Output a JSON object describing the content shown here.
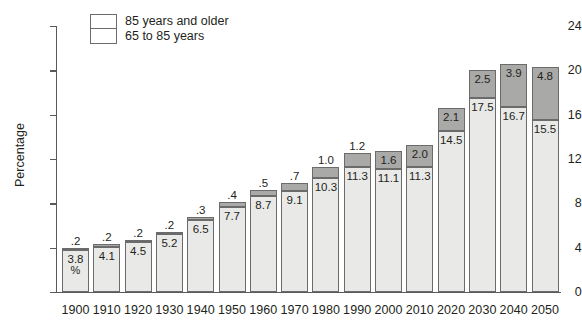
{
  "chart_data": {
    "type": "bar",
    "title": "",
    "subtype": "stacked-bar",
    "xlabel": "",
    "ylabel": "Percentage",
    "ylim": [
      0,
      24
    ],
    "ytick_values": [
      0,
      4,
      8,
      12,
      16,
      20,
      24
    ],
    "ytick_labels": [
      "0",
      "4",
      "8",
      "12",
      "16",
      "20",
      "24"
    ],
    "grid": false,
    "legend_position": "top-left",
    "categories": [
      "1900",
      "1910",
      "1920",
      "1930",
      "1940",
      "1950",
      "1960",
      "1970",
      "1980",
      "1990",
      "2000",
      "2010",
      "2020",
      "2030",
      "2040",
      "2050"
    ],
    "series": [
      {
        "name": "65 to 85 years",
        "color": "#e9e9e7",
        "values": [
          3.8,
          4.1,
          4.5,
          5.2,
          6.5,
          7.7,
          8.7,
          9.1,
          10.3,
          11.3,
          11.1,
          11.3,
          14.5,
          17.5,
          16.7,
          15.5
        ],
        "labels": [
          "3.8",
          "4.1",
          "4.5",
          "5.2",
          "6.5",
          "7.7",
          "8.7",
          "9.1",
          "10.3",
          "11.3",
          "11.1",
          "11.3",
          "14.5",
          "17.5",
          "16.7",
          "15.5"
        ]
      },
      {
        "name": "85 years and older",
        "color": "#a9a9a7",
        "values": [
          0.2,
          0.2,
          0.2,
          0.2,
          0.3,
          0.4,
          0.5,
          0.7,
          1.0,
          1.2,
          1.6,
          2.0,
          2.1,
          2.5,
          3.9,
          4.8
        ],
        "labels": [
          ".2",
          ".2",
          ".2",
          ".2",
          ".3",
          ".4",
          ".5",
          ".7",
          "1.0",
          "1.2",
          "1.6",
          "2.0",
          "2.1",
          "2.5",
          "3.9",
          "4.8"
        ]
      }
    ],
    "totals": [
      4.0,
      4.3,
      4.7,
      5.4,
      6.8,
      8.1,
      9.2,
      9.8,
      11.3,
      12.5,
      12.7,
      13.3,
      16.6,
      20.0,
      20.6,
      20.3
    ],
    "annotations": [
      {
        "category": "1900",
        "text": "%",
        "note": "percent sign shown under first bar's lower value"
      }
    ]
  },
  "legend": {
    "items": [
      {
        "label": "85 years and older",
        "color": "#a9a9a7"
      },
      {
        "label": "65 to 85 years",
        "color": "#e9e9e7"
      }
    ]
  },
  "axis": {
    "y_title": "Percentage"
  }
}
